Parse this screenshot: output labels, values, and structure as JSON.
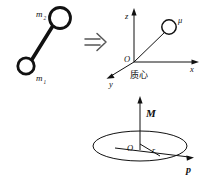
{
  "figure": {
    "background_color": "#ffffff",
    "stroke_color": "#111111"
  },
  "dumbbell": {
    "name": "two-body dumbbell",
    "mass_upper_label": "m",
    "mass_upper_sub": "2",
    "mass_lower_label": "m",
    "mass_lower_sub": "1"
  },
  "implies": {
    "symbol": "⟹",
    "name": "implication arrow"
  },
  "axes3d": {
    "z_label": "z",
    "x_label": "x",
    "y_label": "y",
    "origin_label": "O",
    "center_of_mass_label": "质心",
    "particle_label": "μ"
  },
  "orbit": {
    "angular_momentum_label": "M",
    "origin_label": "O",
    "radius_label": "r",
    "momentum_label": "p"
  }
}
